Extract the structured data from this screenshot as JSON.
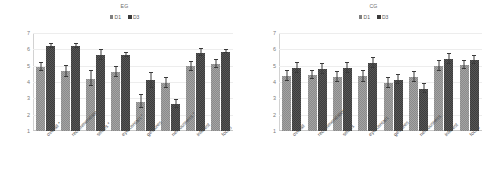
{
  "chart_data": [
    {
      "type": "bar",
      "title": "EG",
      "xlabel": "",
      "ylabel": "",
      "ylim": [
        1,
        7
      ],
      "yticks": [
        1,
        2,
        3,
        4,
        5,
        6,
        7
      ],
      "grid": true,
      "legend_position": "top-center",
      "categories": [
        "overall *",
        "recommendation *",
        "smiles *",
        "eye contact *",
        "gestures",
        "nervousness *",
        "interest",
        "focus"
      ],
      "series": [
        {
          "name": "D1",
          "color": "#8a8a8a",
          "values": [
            4.9,
            4.65,
            4.2,
            4.6,
            2.8,
            3.95,
            4.95,
            5.1
          ],
          "errors": [
            0.25,
            0.35,
            0.45,
            0.3,
            0.4,
            0.3,
            0.3,
            0.25
          ]
        },
        {
          "name": "D3",
          "color": "#3d3d3d",
          "values": [
            6.2,
            6.2,
            5.65,
            5.65,
            4.1,
            2.65,
            5.8,
            5.85
          ],
          "errors": [
            0.1,
            0.1,
            0.3,
            0.1,
            0.45,
            0.25,
            0.2,
            0.1
          ]
        }
      ]
    },
    {
      "type": "bar",
      "title": "CG",
      "xlabel": "",
      "ylabel": "",
      "ylim": [
        1,
        7
      ],
      "yticks": [
        1,
        2,
        3,
        4,
        5,
        6,
        7
      ],
      "grid": true,
      "legend_position": "top-center",
      "categories": [
        "overall",
        "recommendation",
        "smiles",
        "eye contact",
        "gestures",
        "nervousness",
        "interest",
        "focus"
      ],
      "series": [
        {
          "name": "D1",
          "color": "#8a8a8a",
          "values": [
            4.35,
            4.45,
            4.3,
            4.35,
            3.95,
            4.3,
            5.0,
            5.05
          ],
          "errors": [
            0.3,
            0.25,
            0.3,
            0.35,
            0.3,
            0.3,
            0.3,
            0.25
          ]
        },
        {
          "name": "D3",
          "color": "#3d3d3d",
          "values": [
            4.85,
            4.8,
            4.85,
            5.15,
            4.15,
            3.6,
            5.4,
            5.35
          ],
          "errors": [
            0.3,
            0.3,
            0.3,
            0.3,
            0.3,
            0.3,
            0.3,
            0.25
          ]
        }
      ]
    }
  ]
}
